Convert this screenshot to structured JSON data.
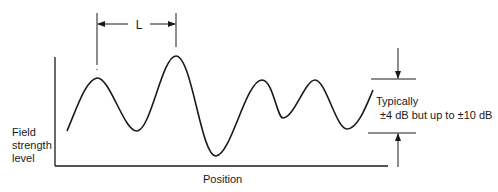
{
  "diagram": {
    "type": "standing-wave field strength variation",
    "y_axis_label": [
      "Field",
      "strength",
      "level"
    ],
    "x_axis_label": "Position",
    "period_label": "L",
    "variation_label_line1": "Typically",
    "variation_label_line2": "±4 dB but up to ±10 dB",
    "colors": {
      "line": "#1a1a1a",
      "background": "#ffffff"
    },
    "curve_points": [
      [
        67,
        131
      ],
      [
        97,
        78
      ],
      [
        137,
        131
      ],
      [
        176,
        56
      ],
      [
        216,
        156
      ],
      [
        262,
        80
      ],
      [
        283,
        118
      ],
      [
        315,
        80
      ],
      [
        347,
        129
      ],
      [
        373,
        90
      ]
    ]
  }
}
